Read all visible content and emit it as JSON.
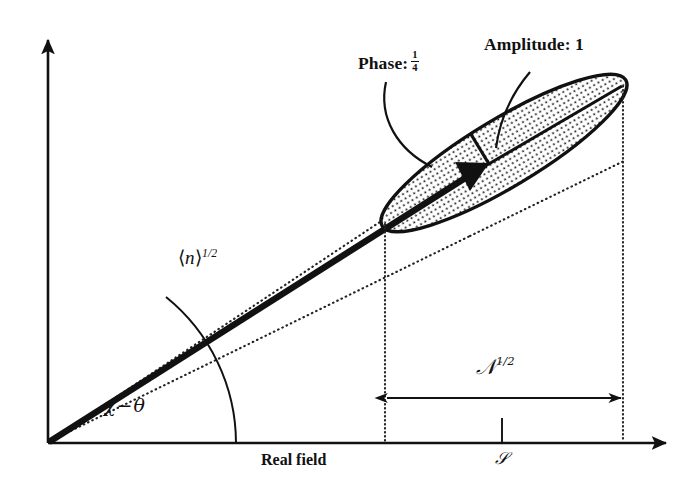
{
  "figure": {
    "background_color": "#ffffff",
    "ink_color": "#111111",
    "title": "",
    "axes": {
      "x_axis_label": "Real field",
      "y_axis_label": "",
      "x_axis_arrow": "arrow-right",
      "y_axis_arrow": "arrow-up"
    },
    "annotations": {
      "phase_label": "Phase:",
      "phase_value_numerator": "1",
      "phase_value_denominator": "4",
      "amplitude_label": "Amplitude: 1",
      "mean_photon_label_bra": "⟨",
      "mean_photon_label_symbol": "n",
      "mean_photon_label_ket": "⟩",
      "mean_photon_label_exponent": "1/2",
      "angle_chi": "χ",
      "angle_operator": "−",
      "angle_theta": "θ",
      "width_symbol": "𝒩",
      "width_exponent": "1/2",
      "tick_label": "𝒮"
    },
    "geometry": {
      "origin_x": 48,
      "origin_y": 443,
      "y_axis_top": 30,
      "x_axis_right": 676,
      "ellipse_center_x": 504,
      "ellipse_center_y": 153,
      "ellipse_semi_major": 142,
      "ellipse_semi_minor": 34,
      "ellipse_rotation_deg": -31,
      "vector_tip_x": 477,
      "vector_tip_y": 170,
      "dim_line_y": 398,
      "dim_left_x": 385,
      "dim_right_x": 623,
      "tick_x": 502,
      "ellipse_fill": "stipple-dots"
    }
  }
}
